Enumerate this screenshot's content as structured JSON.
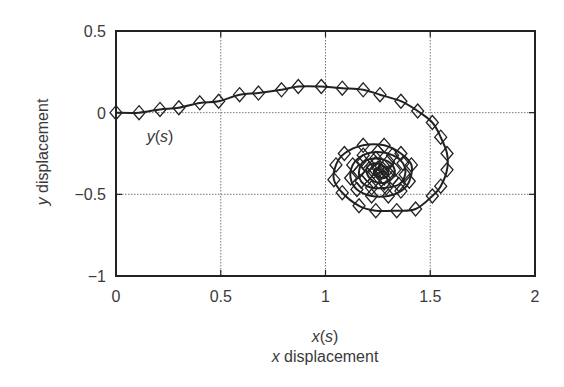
{
  "chart_data": {
    "type": "line",
    "title": "",
    "xlabel": "x(s)",
    "xlabel_sub": "x displacement",
    "ylabel": "y displacement",
    "xlim": [
      0,
      2
    ],
    "ylim": [
      -1,
      0.5
    ],
    "xticks": [
      0,
      0.5,
      1,
      1.5,
      2
    ],
    "xtick_labels": [
      "0",
      "0.5",
      "1",
      "1.5",
      "2"
    ],
    "yticks": [
      0.5,
      0,
      -0.5,
      -1
    ],
    "ytick_labels": [
      "0.5",
      "0",
      "−0.5",
      "−1"
    ],
    "grid": true,
    "legend": null,
    "annotations": [
      {
        "text": "y(s)",
        "x": 0.15,
        "y": -0.15
      }
    ],
    "series": [
      {
        "name": "trajectory (x(s), y(s))",
        "marker": "diamond",
        "color": "#222222",
        "points": [
          [
            0.0,
            0.0
          ],
          [
            0.11,
            0.0
          ],
          [
            0.21,
            0.02
          ],
          [
            0.3,
            0.03
          ],
          [
            0.4,
            0.06
          ],
          [
            0.49,
            0.07
          ],
          [
            0.59,
            0.11
          ],
          [
            0.68,
            0.12
          ],
          [
            0.79,
            0.14
          ],
          [
            0.87,
            0.16
          ],
          [
            0.98,
            0.16
          ],
          [
            1.08,
            0.15
          ],
          [
            1.18,
            0.14
          ],
          [
            1.26,
            0.11
          ],
          [
            1.36,
            0.07
          ],
          [
            1.44,
            0.01
          ],
          [
            1.51,
            -0.06
          ],
          [
            1.55,
            -0.15
          ],
          [
            1.58,
            -0.25
          ],
          [
            1.58,
            -0.35
          ],
          [
            1.55,
            -0.45
          ],
          [
            1.51,
            -0.51
          ],
          [
            1.43,
            -0.59
          ],
          [
            1.34,
            -0.6
          ],
          [
            1.24,
            -0.6
          ],
          [
            1.16,
            -0.57
          ],
          [
            1.08,
            -0.49
          ],
          [
            1.04,
            -0.41
          ],
          [
            1.05,
            -0.32
          ],
          [
            1.09,
            -0.25
          ],
          [
            1.18,
            -0.2
          ],
          [
            1.28,
            -0.2
          ],
          [
            1.36,
            -0.25
          ],
          [
            1.41,
            -0.32
          ],
          [
            1.4,
            -0.42
          ],
          [
            1.36,
            -0.48
          ],
          [
            1.3,
            -0.51
          ],
          [
            1.22,
            -0.51
          ],
          [
            1.15,
            -0.47
          ],
          [
            1.12,
            -0.4
          ],
          [
            1.13,
            -0.32
          ],
          [
            1.18,
            -0.26
          ],
          [
            1.25,
            -0.24
          ],
          [
            1.32,
            -0.26
          ],
          [
            1.37,
            -0.31
          ],
          [
            1.38,
            -0.38
          ],
          [
            1.35,
            -0.44
          ],
          [
            1.29,
            -0.46
          ],
          [
            1.22,
            -0.46
          ],
          [
            1.17,
            -0.42
          ],
          [
            1.16,
            -0.36
          ],
          [
            1.18,
            -0.3
          ],
          [
            1.24,
            -0.28
          ],
          [
            1.3,
            -0.3
          ],
          [
            1.33,
            -0.35
          ],
          [
            1.32,
            -0.4
          ],
          [
            1.28,
            -0.43
          ],
          [
            1.23,
            -0.42
          ],
          [
            1.2,
            -0.38
          ],
          [
            1.2,
            -0.33
          ],
          [
            1.24,
            -0.31
          ],
          [
            1.28,
            -0.33
          ],
          [
            1.3,
            -0.37
          ],
          [
            1.28,
            -0.4
          ],
          [
            1.25,
            -0.39
          ],
          [
            1.23,
            -0.36
          ],
          [
            1.25,
            -0.34
          ],
          [
            1.27,
            -0.36
          ],
          [
            1.26,
            -0.37
          ]
        ]
      }
    ]
  },
  "labels": {
    "annotation_y": "y",
    "annotation_paren_open": "(",
    "annotation_s": "s",
    "annotation_paren_close": ")",
    "xlabel_x": "x",
    "xlabel_s": "s",
    "xlabel_sub_var": "x",
    "xlabel_sub_rest": " displacement",
    "ylabel_var": "y",
    "ylabel_rest": " displacement"
  }
}
